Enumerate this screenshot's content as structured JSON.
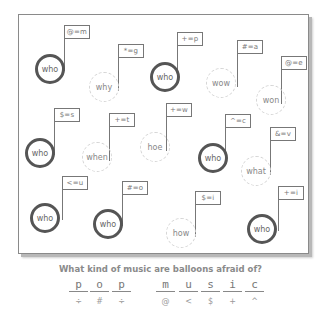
{
  "puzzle": {
    "balloons": [
      {
        "label": "who",
        "style": "bold",
        "code": "@=m",
        "cx": 50,
        "cy": 69,
        "fx": 64,
        "fy": 25
      },
      {
        "label": "why",
        "style": "dashed",
        "code": "*=g",
        "cx": 104,
        "cy": 87,
        "fx": 118,
        "fy": 44
      },
      {
        "label": "who",
        "style": "bold",
        "code": "+=p",
        "cx": 165,
        "cy": 77,
        "fx": 177,
        "fy": 32
      },
      {
        "label": "wow",
        "style": "dashed",
        "code": "#=a",
        "cx": 221,
        "cy": 83,
        "fx": 237,
        "fy": 40
      },
      {
        "label": "won",
        "style": "dashed",
        "code": "@=e",
        "cx": 271,
        "cy": 100,
        "fx": 281,
        "fy": 56
      },
      {
        "label": "who",
        "style": "bold",
        "code": "$=s",
        "cx": 40,
        "cy": 153,
        "fx": 54,
        "fy": 108
      },
      {
        "label": "when",
        "style": "dashed",
        "code": "+=t",
        "cx": 97,
        "cy": 157,
        "fx": 109,
        "fy": 113
      },
      {
        "label": "hoe",
        "style": "dashed",
        "code": "+=w",
        "cx": 155,
        "cy": 147,
        "fx": 166,
        "fy": 103
      },
      {
        "label": "who",
        "style": "bold",
        "code": "^=c",
        "cx": 213,
        "cy": 158,
        "fx": 225,
        "fy": 114
      },
      {
        "label": "what",
        "style": "dashed",
        "code": "&=v",
        "cx": 256,
        "cy": 171,
        "fx": 270,
        "fy": 127
      },
      {
        "label": "who",
        "style": "bold",
        "code": "<=u",
        "cx": 45,
        "cy": 218,
        "fx": 62,
        "fy": 176
      },
      {
        "label": "who",
        "style": "bold",
        "code": "#=o",
        "cx": 108,
        "cy": 224,
        "fx": 122,
        "fy": 181
      },
      {
        "label": "how",
        "style": "dashed",
        "code": "$=i",
        "cx": 181,
        "cy": 233,
        "fx": 195,
        "fy": 191
      },
      {
        "label": "who",
        "style": "bold",
        "code": "+=i",
        "cx": 262,
        "cy": 229,
        "fx": 278,
        "fy": 186
      }
    ]
  },
  "question": "What kind of music are balloons afraid of?",
  "answer": {
    "words": [
      [
        {
          "letter": "p",
          "symbol": "÷",
          "x": 68
        },
        {
          "letter": "o",
          "symbol": "#",
          "x": 89
        },
        {
          "letter": "p",
          "symbol": "÷",
          "x": 111
        }
      ],
      [
        {
          "letter": "m",
          "symbol": "@",
          "x": 155
        },
        {
          "letter": "u",
          "symbol": "<",
          "x": 178
        },
        {
          "letter": "s",
          "symbol": "$",
          "x": 200
        },
        {
          "letter": "i",
          "symbol": "+",
          "x": 222
        },
        {
          "letter": "c",
          "symbol": "^",
          "x": 244
        }
      ]
    ]
  }
}
